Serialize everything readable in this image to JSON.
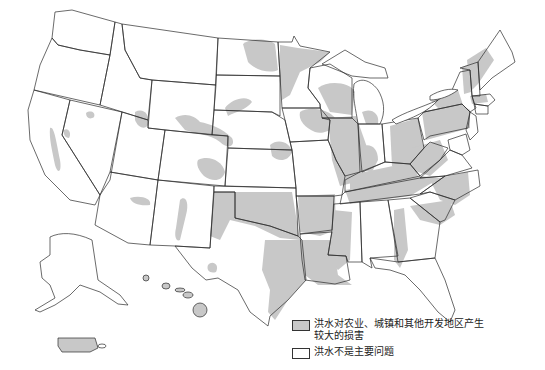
{
  "map": {
    "subject": "United States flood damage map",
    "colors": {
      "flood_damage": "#c8c8c8",
      "no_major_problem": "#ffffff",
      "outline": "#2b2b2b"
    }
  },
  "legend": {
    "items": [
      {
        "label": "洪水对农业、城镇和其他开发地区产生较大的损害",
        "swatch_color": "#c8c8c8"
      },
      {
        "label": "洪水不是主要问题",
        "swatch_color": "#ffffff"
      }
    ]
  }
}
